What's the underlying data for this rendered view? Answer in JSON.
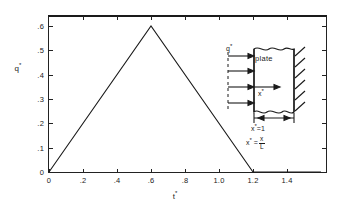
{
  "chart_data": {
    "type": "line",
    "title": "",
    "subtitle": "",
    "xlabel": "t*",
    "ylabel": "q*",
    "xlim": [
      0.0,
      1.6
    ],
    "ylim": [
      0.0,
      0.65
    ],
    "grid": false,
    "legend": null,
    "x_ticks": [
      "0",
      ".2",
      ".4",
      ".6",
      ".8",
      "1.0",
      "1.2",
      "1.4"
    ],
    "x_tick_values": [
      0.0,
      0.2,
      0.4,
      0.6,
      0.8,
      1.0,
      1.2,
      1.4
    ],
    "y_ticks": [
      "0",
      ".1",
      ".2",
      ".3",
      ".4",
      ".5",
      ".6"
    ],
    "y_tick_values": [
      0.0,
      0.1,
      0.2,
      0.3,
      0.4,
      0.5,
      0.6
    ],
    "series": [
      {
        "name": "q*",
        "x": [
          0.0,
          0.6,
          1.2,
          1.6
        ],
        "values": [
          0.0,
          0.6,
          0.0,
          0.0
        ]
      }
    ],
    "annotations": [
      "Triangular heat flux pulse: rises linearly from 0 at t*=0 to a peak of 0.6 at t*=0.6, then decreases linearly back to 0 at t*=1.2 and remains 0 thereafter."
    ]
  },
  "inset": {
    "name": "plate-schematic",
    "flux_label": "q*",
    "plate_label": "plate",
    "coordinate_label": "x*",
    "dimension_label": "x*=1",
    "definition_prefix": "x* =",
    "definition_numerator": "x",
    "definition_denominator": "L",
    "arrow_count": 4,
    "hatch_count": 6
  },
  "style": {
    "background": "#ffffff",
    "line_color": "#1a1a1a",
    "axis_color": "#222222",
    "text_color": "#1a1a1a"
  }
}
